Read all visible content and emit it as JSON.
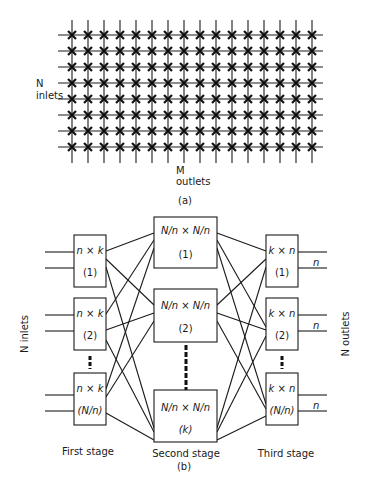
{
  "figure_a": {
    "caption": "(a)",
    "inlets_label_line1": "N",
    "inlets_label_line2": "inlets",
    "outlets_label_line1": "M",
    "outlets_label_line2": "outlets",
    "rows": 8,
    "columns": 16,
    "crosspoint_icon": "x-mark-icon"
  },
  "figure_b": {
    "caption": "(b)",
    "inlets_label": "N inlets",
    "outlets_label": "N outlets",
    "first_stage": {
      "label": "First stage",
      "boxes": [
        {
          "size": "n × k",
          "index": "(1)"
        },
        {
          "size": "n × k",
          "index": "(2)"
        },
        {
          "size": "n × k",
          "index": "(N/n)"
        }
      ]
    },
    "second_stage": {
      "label": "Second stage",
      "boxes": [
        {
          "size": "N/n × N/n",
          "index": "(1)"
        },
        {
          "size": "N/n × N/n",
          "index": "(2)"
        },
        {
          "size": "N/n × N/n",
          "index": "(k)"
        }
      ]
    },
    "third_stage": {
      "label": "Third stage",
      "boxes": [
        {
          "size": "k × n",
          "index": "(1)",
          "outlet_label": "n"
        },
        {
          "size": "k × n",
          "index": "(2)",
          "outlet_label": "n"
        },
        {
          "size": "k × n",
          "index": "(N/n)",
          "outlet_label": "n"
        }
      ]
    }
  }
}
